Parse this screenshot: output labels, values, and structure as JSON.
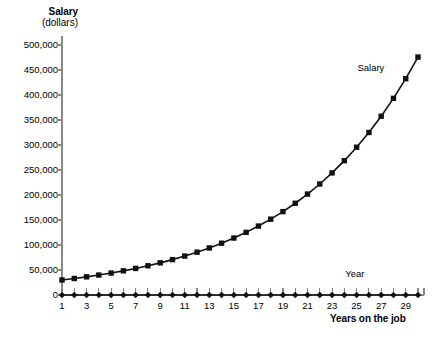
{
  "chart_data": {
    "type": "line",
    "title": "",
    "xlabel": "Years on the job",
    "ylabel": "Salary",
    "ylabel_units": "(dollars)",
    "xlim": [
      1,
      30
    ],
    "ylim": [
      0,
      500000
    ],
    "grid": false,
    "legend_position": "inline-right",
    "x": [
      1,
      2,
      3,
      4,
      5,
      6,
      7,
      8,
      9,
      10,
      11,
      12,
      13,
      14,
      15,
      16,
      17,
      18,
      19,
      20,
      21,
      22,
      23,
      24,
      25,
      26,
      27,
      28,
      29,
      30
    ],
    "series": [
      {
        "name": "Salary",
        "marker": "square",
        "values": [
          30000,
          33000,
          36300,
          39930,
          43923,
          48315,
          53147,
          58462,
          64308,
          70739,
          77813,
          85594,
          94154,
          103569,
          113926,
          125318,
          137850,
          151635,
          166799,
          183478,
          201826,
          222009,
          244210,
          268631,
          295494,
          325043,
          357548,
          393302,
          432633,
          475896
        ]
      },
      {
        "name": "Year",
        "marker": "diamond",
        "values": [
          1,
          2,
          3,
          4,
          5,
          6,
          7,
          8,
          9,
          10,
          11,
          12,
          13,
          14,
          15,
          16,
          17,
          18,
          19,
          20,
          21,
          22,
          23,
          24,
          25,
          26,
          27,
          28,
          29,
          30
        ]
      }
    ],
    "ytick_labels": [
      "500,000",
      "450,000",
      "400,000",
      "350,000",
      "300,000",
      "250,000",
      "200,000",
      "150,000",
      "100,000",
      "50,000",
      "0"
    ],
    "ytick_values": [
      500000,
      450000,
      400000,
      350000,
      300000,
      250000,
      200000,
      150000,
      100000,
      50000,
      0
    ],
    "xtick_labels": [
      "1",
      "3",
      "5",
      "7",
      "9",
      "11",
      "13",
      "15",
      "17",
      "19",
      "21",
      "23",
      "25",
      "27",
      "29"
    ],
    "xtick_values": [
      1,
      3,
      5,
      7,
      9,
      11,
      13,
      15,
      17,
      19,
      21,
      23,
      25,
      27,
      29
    ],
    "annotations": [
      {
        "text": "Salary",
        "x": 28,
        "y": 455000
      },
      {
        "text": "Year",
        "x": 27,
        "y": 42000
      }
    ],
    "colors": {
      "series": "#111111",
      "axis": "#888888",
      "text": "#000000",
      "background": "#ffffff"
    }
  }
}
